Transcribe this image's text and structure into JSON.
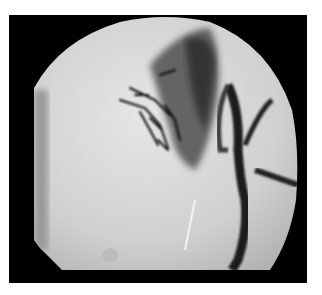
{
  "image": {
    "type": "fluoroscopic angiogram",
    "description": "Circular fluoroscopy field on black background showing contrast-filled vessels in upper center and a dark vertical vessel on the right descending to the bottom",
    "colors": {
      "background": "#000000",
      "field": "#d8d8d8",
      "contrast": "#1a1a1a",
      "page": "#ffffff"
    }
  }
}
